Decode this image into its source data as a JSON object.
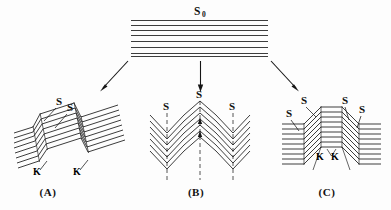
{
  "figure": {
    "title_symbol": "S",
    "title_subscript": "0",
    "background_color": "#fdfdfd",
    "ink_color": "#1a1a1a",
    "width": 391,
    "height": 210
  },
  "source_block": {
    "label_main": "S",
    "label_subscript": "0",
    "description": "undeformed parallel bedding",
    "line_count": 7
  },
  "arrows": [
    {
      "name": "arrow-to-a",
      "direction": "down-left",
      "target": "A"
    },
    {
      "name": "arrow-to-b",
      "direction": "down",
      "target": "B"
    },
    {
      "name": "arrow-to-c",
      "direction": "down-right",
      "target": "C"
    }
  ],
  "panels": [
    {
      "id": "A",
      "caption": "(A)",
      "type": "kink-bands",
      "description": "inclined layering cut by two parallel kink bands",
      "s_labels": [
        "S",
        "S"
      ],
      "k_labels": [
        "K",
        "K"
      ],
      "layer_count": 8
    },
    {
      "id": "B",
      "caption": "(B)",
      "type": "chevron-folds",
      "description": "chevron folds with vertical axial surfaces",
      "s_labels": [
        "S",
        "S",
        "S"
      ],
      "k_labels": [],
      "layer_count": 7
    },
    {
      "id": "C",
      "caption": "(C)",
      "type": "conjugate-kink-box-fold",
      "description": "box fold formed by conjugate kink bands in horizontal layering",
      "s_labels": [
        "S",
        "S",
        "S",
        "S"
      ],
      "k_labels": [
        "K",
        "K"
      ],
      "layer_count": 8
    }
  ],
  "legend_symbols": {
    "S": "axial surface / cleavage trace",
    "K": "kink band boundary",
    "S0": "bedding"
  }
}
